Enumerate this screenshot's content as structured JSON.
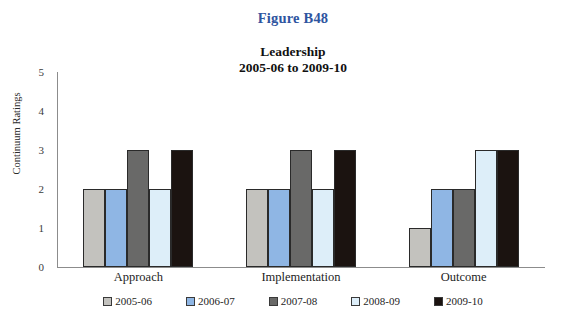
{
  "figure": {
    "caption": "Figure B48",
    "caption_color": "#2f55a0"
  },
  "chart_data": {
    "type": "bar",
    "title": "Leadership",
    "subtitle": "2005-06 to 2009-10",
    "title_line1": "Leadership",
    "title_line2": "2005-06 to 2009-10",
    "xlabel": "",
    "ylabel": "Continuum Ratings",
    "ylim": [
      0,
      5
    ],
    "yticks": [
      5,
      4,
      3,
      2,
      1,
      0
    ],
    "grid": false,
    "legend_position": "bottom",
    "categories": [
      "Approach",
      "Implementation",
      "Outcome"
    ],
    "series": [
      {
        "name": "2005-06",
        "color": "#c3c2be",
        "values": [
          2,
          2,
          1
        ]
      },
      {
        "name": "2006-07",
        "color": "#8fb6e4",
        "values": [
          2,
          2,
          2
        ]
      },
      {
        "name": "2007-08",
        "color": "#696968",
        "values": [
          3,
          3,
          2
        ]
      },
      {
        "name": "2008-09",
        "color": "#ddeef9",
        "values": [
          2,
          2,
          3
        ]
      },
      {
        "name": "2009-10",
        "color": "#1b1310",
        "values": [
          3,
          3,
          3
        ]
      }
    ]
  }
}
